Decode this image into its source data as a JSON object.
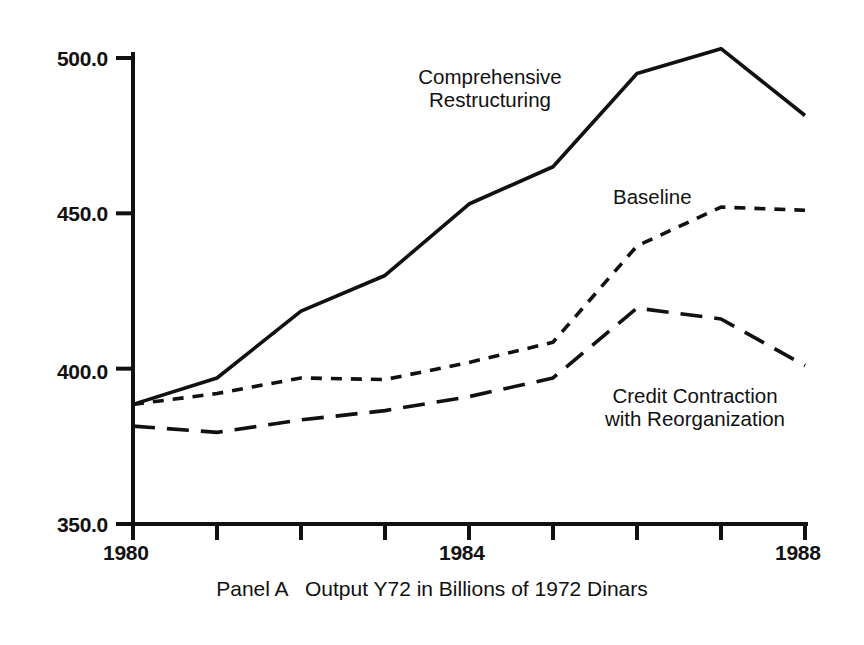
{
  "caption": "Panel A   Output Y72 in Billions of 1972 Dinars",
  "axis": {
    "y_ticks": [
      "500.0",
      "450.0",
      "400.0",
      "350.0"
    ],
    "x_ticks_labeled": [
      "1980",
      "1984",
      "1988"
    ]
  },
  "annotations": {
    "comprehensive": "Comprehensive\nRestructuring",
    "baseline": "Baseline",
    "credit": "Credit Contraction\nwith Reorganization"
  },
  "chart_data": {
    "type": "line",
    "title": "Panel A   Output Y72 in Billions of 1972 Dinars",
    "xlabel": "",
    "ylabel": "Output Y72 in Billions of 1972 Dinars",
    "x": [
      1980,
      1981,
      1982,
      1983,
      1984,
      1985,
      1986,
      1987,
      1988
    ],
    "xlim": [
      1980,
      1988
    ],
    "ylim": [
      350.0,
      500.0
    ],
    "y_tick_values": [
      500.0,
      450.0,
      400.0,
      350.0
    ],
    "x_tick_values": [
      1980,
      1981,
      1982,
      1983,
      1984,
      1985,
      1986,
      1987,
      1988
    ],
    "x_tick_labels_shown": [
      1980,
      1984,
      1988
    ],
    "grid": false,
    "legend": "inline-annotations",
    "series": [
      {
        "name": "Comprehensive Restructuring",
        "style": "solid",
        "values": [
          388.5,
          397.0,
          418.5,
          430.0,
          453.0,
          465.0,
          495.0,
          503.0,
          481.5
        ]
      },
      {
        "name": "Baseline",
        "style": "dotted",
        "values": [
          388.5,
          392.0,
          397.0,
          396.5,
          402.0,
          408.5,
          439.5,
          452.0,
          451.0
        ]
      },
      {
        "name": "Credit Contraction with Reorganization",
        "style": "dashed",
        "values": [
          381.5,
          379.5,
          383.5,
          386.5,
          391.0,
          397.0,
          419.5,
          416.0,
          401.0
        ]
      }
    ]
  },
  "style": {
    "line_color": "#111111",
    "background": "#ffffff",
    "axis_color": "#111111"
  }
}
